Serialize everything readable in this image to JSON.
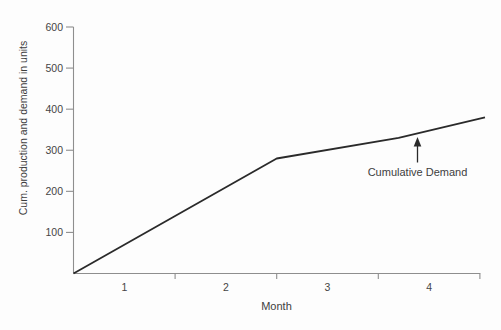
{
  "figure": {
    "background": "#fdfdfd"
  },
  "colors": {
    "bg": "#fdfdfd",
    "axis": "#8e8e8e",
    "ink": "#2a2a2a",
    "tick_text": "#454545",
    "label_text": "#3d3d3d"
  },
  "chart_data": {
    "type": "line",
    "title": "",
    "xlabel": "Month",
    "ylabel": "Cum. production and demand in units",
    "xlim": [
      0,
      4
    ],
    "ylim": [
      0,
      600
    ],
    "x_ticks": [
      1,
      2,
      3,
      4
    ],
    "x_tick_label_position": "centered-in-interval",
    "y_ticks": [
      100,
      200,
      300,
      400,
      500,
      600
    ],
    "grid": false,
    "legend": "none",
    "series": [
      {
        "name": "Cumulative Demand",
        "points": [
          [
            0,
            0
          ],
          [
            1,
            140
          ],
          [
            2,
            280
          ],
          [
            3.2,
            330
          ],
          [
            4.05,
            380
          ]
        ]
      }
    ],
    "annotation": {
      "text": "Cumulative Demand",
      "arrow_points_to_month": 3.39
    }
  }
}
